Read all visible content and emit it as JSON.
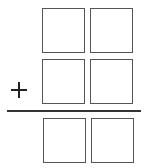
{
  "diagram": {
    "type": "column-addition-puzzle",
    "operator": "+",
    "rows": [
      {
        "name": "addend-1",
        "digits": [
          "",
          ""
        ]
      },
      {
        "name": "addend-2",
        "digits": [
          "",
          ""
        ]
      },
      {
        "name": "sum",
        "digits": [
          "",
          ""
        ]
      }
    ],
    "colors": {
      "box_border": "#555555",
      "line": "#333333",
      "background": "#ffffff"
    }
  }
}
